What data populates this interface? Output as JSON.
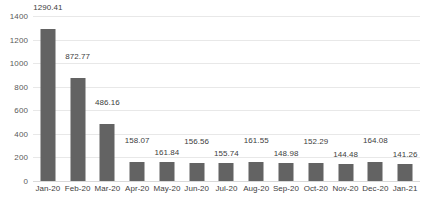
{
  "chart_data": {
    "type": "bar",
    "title": "",
    "subtitle": "",
    "xlabel": "",
    "ylabel": "",
    "ylim": [
      0,
      1400
    ],
    "ytick_step": 200,
    "ytick_labels": [
      "0",
      "200",
      "400",
      "600",
      "800",
      "1000",
      "1200",
      "1400"
    ],
    "grid": true,
    "legend": false,
    "bar_color": "#636363",
    "gridline_color": "#e8e8e8",
    "categories": [
      "Jan-20",
      "Feb-20",
      "Mar-20",
      "Apr-20",
      "May-20",
      "Jun-20",
      "Jul-20",
      "Aug-20",
      "Sep-20",
      "Oct-20",
      "Nov-20",
      "Dec-20",
      "Jan-21"
    ],
    "values": [
      1290.41,
      872.77,
      486.16,
      158.07,
      161.84,
      156.56,
      155.74,
      161.55,
      148.98,
      152.29,
      144.48,
      164.08,
      141.26
    ],
    "data_labels": [
      "1290.41",
      "872.77",
      "486.16",
      "158.07",
      "161.84",
      "156.56",
      "155.74",
      "161.55",
      "148.98",
      "152.29",
      "144.48",
      "164.08",
      "141.26"
    ],
    "data_label_offsets": [
      "high",
      "high",
      "high",
      "high",
      "low",
      "high",
      "low",
      "high",
      "low",
      "high",
      "low",
      "high",
      "low"
    ]
  }
}
